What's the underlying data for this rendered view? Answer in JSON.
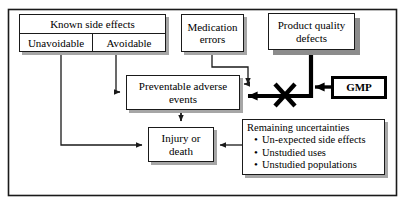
{
  "diagram": {
    "type": "flowchart",
    "frame": {
      "name": "outer-border"
    },
    "nodes": {
      "known_side_effects": {
        "header": "Known side effects",
        "cells": [
          "Unavoidable",
          "Avoidable"
        ]
      },
      "medication_errors": {
        "line1": "Medication",
        "line2": "errors"
      },
      "product_quality_defects": {
        "line1": "Product quality",
        "line2": "defects"
      },
      "preventable_adverse_events": {
        "line1": "Preventable adverse",
        "line2": "events"
      },
      "injury_or_death": {
        "line1": "Injury or",
        "line2": "death"
      },
      "gmp": {
        "label": "GMP"
      },
      "remaining_uncertainties": {
        "title": "Remaining uncertainties",
        "items": [
          "Un-expected side effects",
          "Unstudied uses",
          "Unstudied populations"
        ]
      }
    },
    "edges": [
      {
        "name": "unavoidable-to-injury",
        "from": "Unavoidable",
        "to": "Injury or death",
        "style": "thin"
      },
      {
        "name": "avoidable-to-preventable",
        "from": "Avoidable",
        "to": "Preventable adverse events",
        "style": "thin"
      },
      {
        "name": "medication-errors-to-preventable",
        "from": "Medication errors",
        "to": "Preventable adverse events",
        "style": "thin"
      },
      {
        "name": "product-quality-to-preventable",
        "from": "Product quality defects",
        "to": "Preventable adverse events",
        "style": "thick"
      },
      {
        "name": "gmp-blocks-product-quality",
        "from": "GMP",
        "to": "Product quality defects path",
        "style": "thick"
      },
      {
        "name": "preventable-to-injury",
        "from": "Preventable adverse events",
        "to": "Injury or death",
        "style": "thin"
      },
      {
        "name": "uncertainties-to-injury",
        "from": "Remaining uncertainties",
        "to": "Injury or death",
        "style": "thin"
      }
    ],
    "markers": {
      "blocked_cross": {
        "name": "x-block-marker",
        "color": "#000000"
      }
    },
    "colors": {
      "line": "#1a1a1a",
      "heavy_line": "#000000",
      "shadow": "#a6a6a6",
      "background": "#ffffff"
    }
  }
}
